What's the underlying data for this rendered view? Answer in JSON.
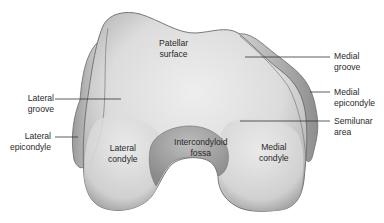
{
  "figure": {
    "colors": {
      "background": "#ffffff",
      "bone_light": "#e6e6e6",
      "bone_mid": "#c9c9c9",
      "bone_shadow": "#8f8f8f",
      "outline": "#6a6a6a",
      "leader_line": "#333333",
      "text": "#2a2a2a"
    }
  },
  "labels": {
    "patellar_surface": {
      "line1": "Patellar",
      "line2": "surface"
    },
    "lateral_groove": {
      "line1": "Lateral",
      "line2": "groove"
    },
    "lateral_epicondyle": {
      "line1": "Lateral",
      "line2": "epicondyle"
    },
    "lateral_condyle": {
      "line1": "Lateral",
      "line2": "condyle"
    },
    "intercondyloid_fossa": {
      "line1": "Intercondyloid",
      "line2": "fossa"
    },
    "medial_condyle": {
      "line1": "Medial",
      "line2": "condyle"
    },
    "medial_groove": {
      "line1": "Medial",
      "line2": "groove"
    },
    "medial_epicondyle": {
      "line1": "Medial",
      "line2": "epicondyle"
    },
    "semilunar_area": {
      "line1": "Semilunar",
      "line2": "area"
    }
  }
}
